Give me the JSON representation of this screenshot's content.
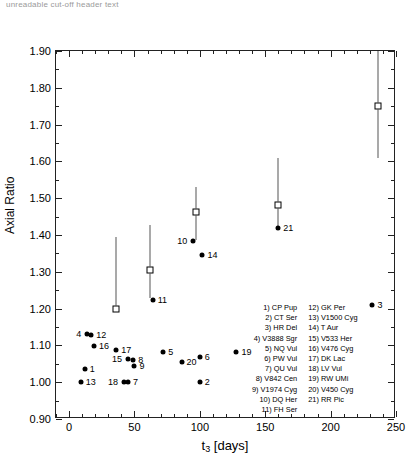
{
  "top_fragment": "unreadable cut-off header text",
  "chart_data": {
    "type": "scatter",
    "title": "",
    "xlabel": "t3 [days]",
    "xlabel_base": "t",
    "xlabel_sub": "3",
    "xlabel_unit": " [days]",
    "ylabel": "Axial Ratio",
    "xlim": [
      -10,
      250
    ],
    "ylim": [
      0.9,
      1.9
    ],
    "xticks": [
      0,
      50,
      100,
      150,
      200,
      250
    ],
    "xticklabels": [
      "0",
      "50",
      "100",
      "150",
      "200",
      "250"
    ],
    "yticks": [
      0.9,
      1.0,
      1.1,
      1.2,
      1.3,
      1.4,
      1.5,
      1.6,
      1.7,
      1.8,
      1.9
    ],
    "yticklabels": [
      "0.90",
      "1.00",
      "1.10",
      "1.20",
      "1.30",
      "1.40",
      "1.50",
      "1.60",
      "1.70",
      "1.80",
      "1.90"
    ],
    "minor_xtick_step": 10,
    "minor_ytick_step": 0.05,
    "grid": false,
    "legend_position": "inside-lower-right",
    "series": [
      {
        "name": "novae",
        "marker": "filled-circle",
        "points": [
          {
            "id": 1,
            "x": 12,
            "y": 1.035,
            "label": "1",
            "label_side": "right"
          },
          {
            "id": 2,
            "x": 100,
            "y": 1.0,
            "label": "2",
            "label_side": "right"
          },
          {
            "id": 3,
            "x": 232,
            "y": 1.21,
            "label": "3",
            "label_side": "right"
          },
          {
            "id": 4,
            "x": 14,
            "y": 1.132,
            "label": "4",
            "label_side": "left"
          },
          {
            "id": 5,
            "x": 72,
            "y": 1.082,
            "label": "5",
            "label_side": "right"
          },
          {
            "id": 6,
            "x": 100,
            "y": 1.068,
            "label": "6",
            "label_side": "right"
          },
          {
            "id": 7,
            "x": 45,
            "y": 1.0,
            "label": "7",
            "label_side": "right"
          },
          {
            "id": 8,
            "x": 49,
            "y": 1.06,
            "label": "8",
            "label_side": "right"
          },
          {
            "id": 9,
            "x": 50,
            "y": 1.043,
            "label": "9",
            "label_side": "right"
          },
          {
            "id": 10,
            "x": 95,
            "y": 1.383,
            "label": "10",
            "label_side": "left"
          },
          {
            "id": 11,
            "x": 64,
            "y": 1.224,
            "label": "11",
            "label_side": "right"
          },
          {
            "id": 12,
            "x": 17,
            "y": 1.127,
            "label": "12",
            "label_side": "right"
          },
          {
            "id": 13,
            "x": 9,
            "y": 1.0,
            "label": "13",
            "label_side": "right"
          },
          {
            "id": 14,
            "x": 102,
            "y": 1.347,
            "label": "14",
            "label_side": "right"
          },
          {
            "id": 15,
            "x": 45,
            "y": 1.062,
            "label": "15",
            "label_side": "left"
          },
          {
            "id": 16,
            "x": 19,
            "y": 1.098,
            "label": "16",
            "label_side": "right"
          },
          {
            "id": 17,
            "x": 36,
            "y": 1.088,
            "label": "17",
            "label_side": "right"
          },
          {
            "id": 18,
            "x": 42,
            "y": 1.0,
            "label": "18",
            "label_side": "left"
          },
          {
            "id": 19,
            "x": 128,
            "y": 1.083,
            "label": "19",
            "label_side": "right"
          },
          {
            "id": 20,
            "x": 86,
            "y": 1.054,
            "label": "20",
            "label_side": "right"
          },
          {
            "id": 21,
            "x": 160,
            "y": 1.418,
            "label": "21",
            "label_side": "right"
          }
        ]
      },
      {
        "name": "mean-values",
        "marker": "open-square",
        "points": [
          {
            "x": 36,
            "y": 1.2,
            "yerr_low": 1.2,
            "yerr_high": 1.394
          },
          {
            "x": 62,
            "y": 1.305,
            "yerr_low": 1.228,
            "yerr_high": 1.427
          },
          {
            "x": 97,
            "y": 1.463,
            "yerr_low": 1.386,
            "yerr_high": 1.53
          },
          {
            "x": 160,
            "y": 1.482,
            "yerr_low": 1.424,
            "yerr_high": 1.608
          },
          {
            "x": 236,
            "y": 1.75,
            "yerr_low": 1.61,
            "yerr_high": 1.9
          }
        ]
      }
    ],
    "legend_columns": [
      [
        "1) CP Pup",
        "2) CT Ser",
        "3) HR Del",
        "4) V3888 Sgr",
        "5) NQ Vul",
        "6) PW Vul",
        "7) QU Vul",
        "8) V842 Cen",
        "9) V1974 Cyg",
        "10) DQ Her",
        "11) FH Ser"
      ],
      [
        "12) GK Per",
        "13) V1500 Cyg",
        "14) T Aur",
        "15) V533 Her",
        "16) V476 Cyg",
        "17) DK Lac",
        "18) LV Vul",
        "19) RW UMi",
        "20) V450 Cyg",
        "21) RR Pic"
      ]
    ]
  }
}
